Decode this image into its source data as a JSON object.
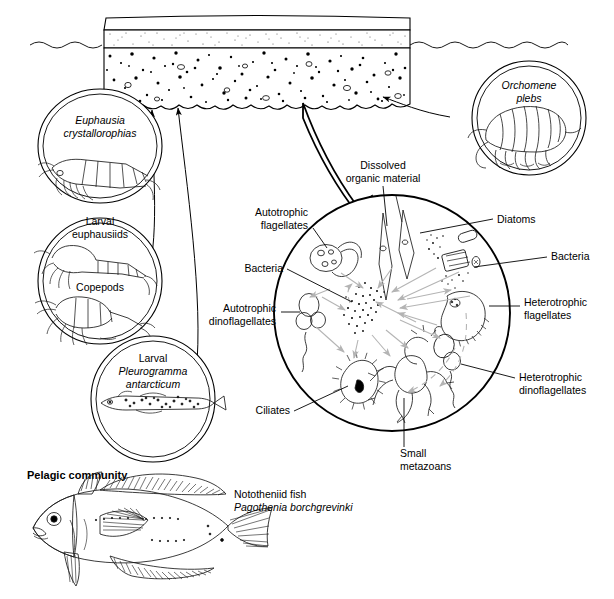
{
  "scene": {
    "sea_ice": {
      "name": "sea-ice-slab",
      "layers": [
        "snow-layer",
        "stippled-ice-layer",
        "algae-laden-bottom-ice"
      ]
    },
    "waterline": {
      "name": "sea-surface-waterline"
    }
  },
  "grazer_circles": [
    {
      "id": "euphausia",
      "lines": [
        {
          "text": "Euphausia",
          "italic": true
        },
        {
          "text": "crystallorophias",
          "italic": true
        }
      ],
      "organism": "euphausiid-krill-illustration"
    },
    {
      "id": "larval-euphausiids-copepods",
      "lines": [
        {
          "text": "Larval",
          "italic": false
        },
        {
          "text": "euphausiids",
          "italic": false
        }
      ],
      "second_label": {
        "text": "Copepods",
        "italic": false
      },
      "organism": "larval-euphausiid-and-copepod-illustration"
    },
    {
      "id": "larval-pleurogramma",
      "lines": [
        {
          "text": "Larval",
          "italic": false
        },
        {
          "text": "Pleurogramma",
          "italic": true
        },
        {
          "text": "antarcticum",
          "italic": true
        }
      ],
      "organism": "larval-fish-illustration"
    },
    {
      "id": "orchomene",
      "lines": [
        {
          "text": "Orchomene",
          "italic": true
        },
        {
          "text": "plebs",
          "italic": true
        }
      ],
      "organism": "amphipod-illustration"
    }
  ],
  "microbial_loop": {
    "name": "microbial-loop-circle",
    "dissolved_organic_material": {
      "line1": "Dissolved",
      "line2": "organic material"
    },
    "labels": [
      {
        "id": "autotrophic-flagellates",
        "line1": "Autotrophic",
        "line2": "flagellates",
        "side": "left"
      },
      {
        "id": "bacteria-left",
        "line1": "Bacteria",
        "line2": "",
        "side": "left"
      },
      {
        "id": "autotrophic-dinoflagellates",
        "line1": "Autotrophic",
        "line2": "dinoflagellates",
        "side": "left"
      },
      {
        "id": "ciliates",
        "line1": "Ciliates",
        "line2": "",
        "side": "left"
      },
      {
        "id": "diatoms",
        "line1": "Diatoms",
        "line2": "",
        "side": "right"
      },
      {
        "id": "bacteria-right",
        "line1": "Bacteria",
        "line2": "",
        "side": "right"
      },
      {
        "id": "heterotrophic-flagellates",
        "line1": "Heterotrophic",
        "line2": "flagellates",
        "side": "right"
      },
      {
        "id": "heterotrophic-dinoflagellates",
        "line1": "Heterotrophic",
        "line2": "dinoflagellates",
        "side": "right"
      },
      {
        "id": "small-metazoans",
        "line1": "Small",
        "line2": "metazoans",
        "side": "bottom"
      }
    ]
  },
  "pelagic": {
    "heading": "Pelagic community",
    "fish_label": {
      "line1": "Nototheniid fish",
      "line2": "Pagothenia borchgrevinki"
    },
    "fish_illustration": "nototheniid-fish-illustration"
  },
  "colors": {
    "ink": "#000000",
    "grey_arrow": "#b4b4b4",
    "background": "#ffffff"
  }
}
